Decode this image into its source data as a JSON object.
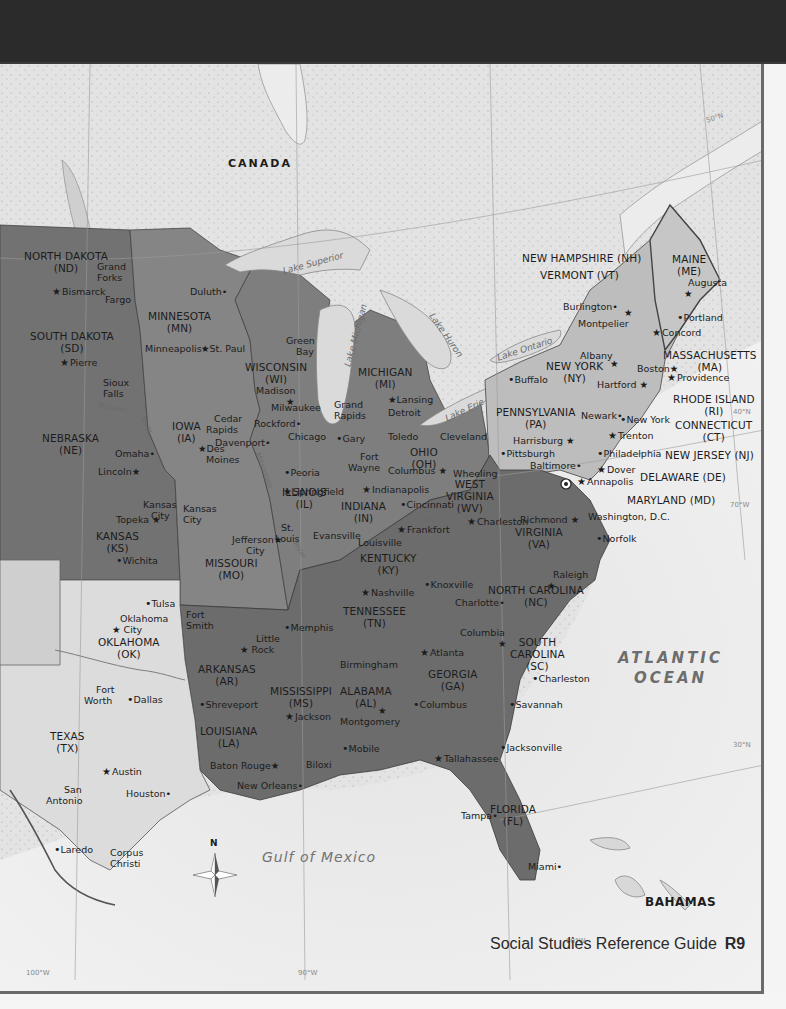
{
  "map": {
    "countries": {
      "canada": "CANADA",
      "bahamas": "BAHAMAS"
    },
    "water": {
      "lake_superior": "Lake Superior",
      "lake_michigan": "Lake Michigan",
      "lake_huron": "Lake Huron",
      "lake_erie": "Lake Erie",
      "lake_ontario": "Lake Ontario",
      "missouri_river": "Missouri",
      "river": "River",
      "ohio_river": "Ohio",
      "mississippi_river": "Mississippi",
      "atlantic_1": "ATLANTIC",
      "atlantic_2": "OCEAN",
      "gulf": "Gulf of Mexico"
    },
    "coords": {
      "n50": "50°N",
      "n40": "40°N",
      "n30": "30°N",
      "w70": "70°W",
      "w80": "80°W",
      "w90": "90°W",
      "w100": "100°W"
    },
    "compass": {
      "north": "N"
    },
    "states": {
      "nd": {
        "name": "NORTH DAKOTA",
        "abbr": "(ND)"
      },
      "sd": {
        "name": "SOUTH DAKOTA",
        "abbr": "(SD)"
      },
      "ne": {
        "name": "NEBRASKA",
        "abbr": "(NE)"
      },
      "ks": {
        "name": "KANSAS",
        "abbr": "(KS)"
      },
      "ok": {
        "name": "OKLAHOMA",
        "abbr": "(OK)"
      },
      "tx": {
        "name": "TEXAS",
        "abbr": "(TX)"
      },
      "mn": {
        "name": "MINNESOTA",
        "abbr": "(MN)"
      },
      "ia": {
        "name": "IOWA",
        "abbr": "(IA)"
      },
      "mo": {
        "name": "MISSOURI",
        "abbr": "(MO)"
      },
      "ar": {
        "name": "ARKANSAS",
        "abbr": "(AR)"
      },
      "la": {
        "name": "LOUISIANA",
        "abbr": "(LA)"
      },
      "wi": {
        "name": "WISCONSIN",
        "abbr": "(WI)"
      },
      "il": {
        "name": "ILLINOIS",
        "abbr": "(IL)"
      },
      "mi": {
        "name": "MICHIGAN",
        "abbr": "(MI)"
      },
      "in": {
        "name": "INDIANA",
        "abbr": "(IN)"
      },
      "oh": {
        "name": "OHIO",
        "abbr": "(OH)"
      },
      "ky": {
        "name": "KENTUCKY",
        "abbr": "(KY)"
      },
      "tn": {
        "name": "TENNESSEE",
        "abbr": "(TN)"
      },
      "ms": {
        "name": "MISSISSIPPI",
        "abbr": "(MS)"
      },
      "al": {
        "name": "ALABAMA",
        "abbr": "(AL)"
      },
      "ga": {
        "name": "GEORGIA",
        "abbr": "(GA)"
      },
      "fl": {
        "name": "FLORIDA",
        "abbr": "(FL)"
      },
      "sc": {
        "name": "SOUTH",
        "name2": "CAROLINA",
        "abbr": "(SC)"
      },
      "nc": {
        "name": "NORTH CAROLINA",
        "abbr": "(NC)"
      },
      "va": {
        "name": "VIRGINIA",
        "abbr": "(VA)"
      },
      "wv": {
        "name": "WEST",
        "name2": "VIRGINIA",
        "abbr": "(WV)"
      },
      "pa": {
        "name": "PENNSYLVANIA",
        "abbr": "(PA)"
      },
      "ny": {
        "name": "NEW YORK",
        "abbr": "(NY)"
      },
      "me": {
        "name": "MAINE",
        "abbr": "(ME)"
      },
      "ma": {
        "name": "MASSACHUSETTS",
        "abbr": "(MA)"
      },
      "ri": {
        "name": "RHODE ISLAND",
        "abbr": "(RI)"
      },
      "ct": {
        "name": "CONNECTICUT",
        "abbr": "(CT)"
      },
      "nh": {
        "name": "NEW HAMPSHIRE (NH)"
      },
      "vt": {
        "name": "VERMONT (VT)"
      },
      "nj": {
        "name": "NEW JERSEY (NJ)"
      },
      "de": {
        "name": "DELAWARE (DE)"
      },
      "md": {
        "name": "MARYLAND (MD)"
      }
    },
    "capitals": {
      "bismarck": "Bismarck",
      "pierre": "Pierre",
      "lincoln": "Lincoln",
      "topeka": "Topeka",
      "oklahoma_city_1": "Oklahoma",
      "oklahoma_city_2": "City",
      "austin": "Austin",
      "st_paul": "St. Paul",
      "des_moines_1": "Des",
      "des_moines_2": "Moines",
      "jefferson_city_1": "Jefferson",
      "jefferson_city_2": "City",
      "little_rock_1": "Little",
      "little_rock_2": "Rock",
      "baton_rouge": "Baton Rouge",
      "madison": "Madison",
      "springfield": "Springfield",
      "lansing": "Lansing",
      "indianapolis": "Indianapolis",
      "columbus_oh": "Columbus",
      "frankfort": "Frankfort",
      "nashville": "Nashville",
      "jackson": "Jackson",
      "montgomery": "Montgomery",
      "atlanta": "Atlanta",
      "tallahassee": "Tallahassee",
      "columbia": "Columbia",
      "raleigh": "Raleigh",
      "richmond": "Richmond",
      "charleston_wv": "Charleston",
      "harrisburg": "Harrisburg",
      "albany": "Albany",
      "montpelier": "Montpelier",
      "concord": "Concord",
      "augusta": "Augusta",
      "boston": "Boston",
      "providence": "Providence",
      "hartford": "Hartford",
      "trenton": "Trenton",
      "dover": "Dover",
      "annapolis": "Annapolis",
      "washington_dc": "Washington, D.C."
    },
    "cities": {
      "grand_forks_1": "Grand",
      "grand_forks_2": "Forks",
      "fargo": "Fargo",
      "sioux_falls_1": "Sioux",
      "sioux_falls_2": "Falls",
      "omaha": "Omaha",
      "kansas_city_ks_1": "Kansas",
      "kansas_city_ks_2": "City",
      "kansas_city_mo_1": "Kansas",
      "kansas_city_mo_2": "City",
      "wichita": "Wichita",
      "tulsa": "Tulsa",
      "fort_worth_1": "Fort",
      "fort_worth_2": "Worth",
      "dallas": "Dallas",
      "san_antonio_1": "San",
      "san_antonio_2": "Antonio",
      "houston": "Houston",
      "laredo": "Laredo",
      "corpus_christi_1": "Corpus",
      "corpus_christi_2": "Christi",
      "duluth": "Duluth",
      "minneapolis": "Minneapolis",
      "cedar_rapids_1": "Cedar",
      "cedar_rapids_2": "Rapids",
      "davenport": "Davenport",
      "st_louis_1": "St.",
      "st_louis_2": "Louis",
      "fort_smith_1": "Fort",
      "fort_smith_2": "Smith",
      "shreveport": "Shreveport",
      "new_orleans": "New Orleans",
      "green_bay_1": "Green",
      "green_bay_2": "Bay",
      "milwaukee": "Milwaukee",
      "rockford": "Rockford",
      "chicago": "Chicago",
      "peoria": "Peoria",
      "gary": "Gary",
      "grand_rapids_1": "Grand",
      "grand_rapids_2": "Rapids",
      "detroit": "Detroit",
      "toledo": "Toledo",
      "cleveland": "Cleveland",
      "fort_wayne_1": "Fort",
      "fort_wayne_2": "Wayne",
      "cincinnati": "Cincinnati",
      "evansville": "Evansville",
      "louisville": "Louisville",
      "memphis": "Memphis",
      "knoxville": "Knoxville",
      "charlotte": "Charlotte",
      "birmingham": "Birmingham",
      "mobile": "Mobile",
      "biloxi": "Biloxi",
      "columbus_ga": "Columbus",
      "savannah": "Savannah",
      "charleston_sc": "Charleston",
      "jacksonville": "Jacksonville",
      "tampa": "Tampa",
      "miami": "Miami",
      "norfolk": "Norfolk",
      "baltimore": "Baltimore",
      "philadelphia": "Philadelphia",
      "pittsburgh": "Pittsburgh",
      "wheeling": "Wheeling",
      "buffalo": "Buffalo",
      "newark": "Newark",
      "new_york": "New York",
      "burlington": "Burlington",
      "portland": "Portland"
    }
  },
  "footer": {
    "title": "Social Studies Reference Guide",
    "page": "R9"
  },
  "colors": {
    "land_dark": "#6e6e6e",
    "land_mid": "#8c8c8c",
    "land_light": "#b8b8b8",
    "land_pale": "#dcdcdc",
    "canada": "#e2e2e2",
    "water": "#ececec"
  }
}
